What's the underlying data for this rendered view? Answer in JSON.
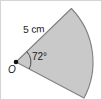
{
  "figure": {
    "type": "circular-sector",
    "background_color": "#ffffff",
    "border_color": "#d4d4d4",
    "sector": {
      "fill_color": "#c9c9c9",
      "stroke_color": "#808080",
      "stroke_width": 1,
      "centre_x": 16,
      "centre_y": 62,
      "radius_px": 77,
      "start_angle_deg": -44,
      "end_angle_deg": 28,
      "sweep_deg": 72
    },
    "vertex_dot": {
      "color": "#111111",
      "x": 16,
      "y": 62,
      "radius": 2.2
    },
    "angle_arc": {
      "stroke_color": "#333333",
      "radius_px": 15
    },
    "labels": {
      "radius_label": "5 cm",
      "angle_label": "72°",
      "vertex_label": "O"
    }
  }
}
